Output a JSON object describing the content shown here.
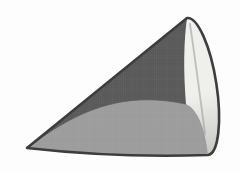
{
  "figure": {
    "type": "geometric-solid-cone"
  },
  "colors": {
    "background": "#fdfdfd",
    "outline": "#3d3d3d",
    "surface_dark": "#585858",
    "surface_medium": "#9b9b9b",
    "base_light_top": "#efefec",
    "base_light_bottom": "#c9c9c4",
    "inner_shadow_line": "#8b8b8b",
    "texture_line": "rgba(255,255,255,0.09)"
  },
  "geometry": {
    "canvas_width": 240,
    "canvas_height": 171,
    "apex": [
      27,
      148
    ],
    "base_ellipse_top": [
      187,
      18
    ],
    "base_ellipse_bottom": [
      208,
      155
    ],
    "base_ellipse_center": [
      197.5,
      86.5
    ],
    "base_ellipse_radii": [
      19,
      69
    ],
    "base_ellipse_rotation_deg": -8.75
  }
}
